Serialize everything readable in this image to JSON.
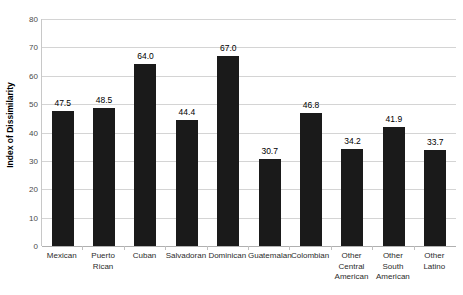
{
  "chart_data": {
    "type": "bar",
    "title": "",
    "xlabel": "",
    "ylabel": "Index of Dissimilarity",
    "ylim": [
      0,
      80
    ],
    "yticks": [
      0,
      10,
      20,
      30,
      40,
      50,
      60,
      70,
      80
    ],
    "grid": true,
    "legend": false,
    "bar_color": "#1a1a1a",
    "gridline_color": "#d4d4d4",
    "categories": [
      "Mexican",
      "Puerto Rican",
      "Cuban",
      "Salvadoran",
      "Dominican",
      "Guatemalan",
      "Colombian",
      "Other Central American",
      "Other South American",
      "Other Latino"
    ],
    "category_lines": [
      [
        "Mexican"
      ],
      [
        "Puerto",
        "Rican"
      ],
      [
        "Cuban"
      ],
      [
        "Salvadoran"
      ],
      [
        "Dominican"
      ],
      [
        "Guatemalan"
      ],
      [
        "Colombian"
      ],
      [
        "Other",
        "Central",
        "American"
      ],
      [
        "Other South",
        "American"
      ],
      [
        "Other",
        "Latino"
      ]
    ],
    "values": [
      47.5,
      48.5,
      64.0,
      44.4,
      67.0,
      30.7,
      46.8,
      34.2,
      41.9,
      33.7
    ],
    "value_labels": [
      "47.5",
      "48.5",
      "64.0",
      "44.4",
      "67.0",
      "30.7",
      "46.8",
      "34.2",
      "41.9",
      "33.7"
    ]
  }
}
